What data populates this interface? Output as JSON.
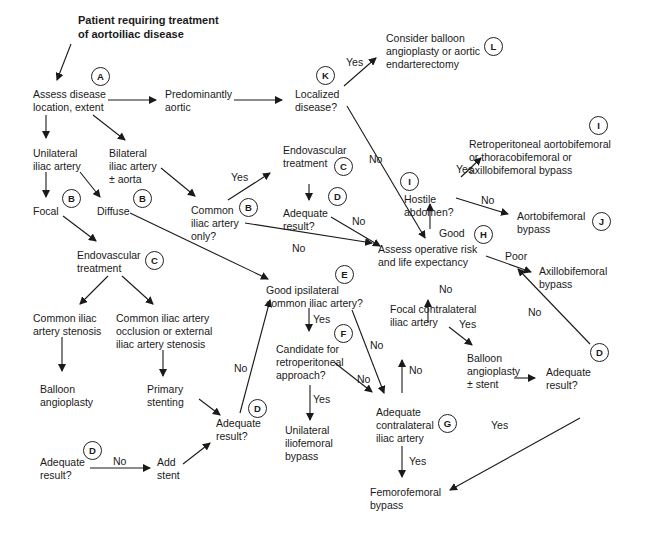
{
  "title": "Patient requiring treatment\nof aortoiliac disease",
  "nodes": {
    "assess": "Assess disease\nlocation, extent",
    "aortic": "Predominantly\naortic",
    "localized": "Localized\ndisease?",
    "balloon_aortic": "Consider balloon\nangioplasty or aortic\nendarterectomy",
    "unilateral": "Unilateral\niliac artery",
    "bilateral": "Bilateral\niliac artery\n± aorta",
    "focal": "Focal",
    "diffuse": "Diffuse",
    "common_only": "Common\niliac artery\nonly?",
    "endo_top": "Endovascular\ntreatment",
    "adequate_top": "Adequate\nresult?",
    "endo_mid": "Endovascular\ntreatment",
    "cia_stenosis": "Common iliac\nartery stenosis",
    "cia_occlusion": "Common iliac artery\nocclusion or external\niliac artery stenosis",
    "balloon": "Balloon\nangioplasty",
    "primary_stent": "Primary\nstenting",
    "adequate_bl": "Adequate\nresult?",
    "add_stent": "Add\nstent",
    "adequate_mid": "Adequate\nresult?",
    "good_ipsi": "Good ipsilateral\ncommon iliac artery?",
    "candidate": "Candidate for\nretroperitoneal\napproach?",
    "uni_ilio": "Unilateral\niliofemoral\nbypass",
    "adequate_contra": "Adequate\ncontralateral\niliac artery",
    "femfem": "Femorofemoral\nbypass",
    "focal_contra": "Focal contralateral\niliac artery",
    "balloon_stent": "Balloon\nangioplasty\n± stent",
    "adequate_right": "Adequate\nresult?",
    "op_risk": "Assess operative risk\nand life expectancy",
    "hostile": "Hostile\nabdomen?",
    "retro": "Retroperitoneal aortobifemoral\nor thoracobifemoral or\naxillobifemoral bypass",
    "aortobi": "Aortobifemoral\nbypass",
    "axillo": "Axillobifemoral\nbypass"
  },
  "badges": {
    "A": "A",
    "B1": "B",
    "B2": "B",
    "B3": "B",
    "C1": "C",
    "C2": "C",
    "D1": "D",
    "D2": "D",
    "D3": "D",
    "D4": "D",
    "E": "E",
    "F": "F",
    "G": "G",
    "H": "H",
    "I1": "I",
    "I2": "I",
    "J": "J",
    "K": "K",
    "L": "L"
  },
  "edge_labels": {
    "yes_localized": "Yes",
    "no_localized": "No",
    "yes_common": "Yes",
    "no_common": "No",
    "no_adequate_top": "No",
    "yes_hostile": "Yes",
    "no_hostile": "No",
    "good": "Good",
    "poor": "Poor",
    "no_focal_contra": "No",
    "yes_focal_contra": "Yes",
    "no_adequate_right": "No",
    "yes_adequate_right": "Yes",
    "yes_good_ipsi": "Yes",
    "no_good_ipsi": "No",
    "no_candidate": "No",
    "yes_candidate": "Yes",
    "no_adequate_contra": "No",
    "yes_adequate_contra": "Yes",
    "no_adequate_mid": "No",
    "no_adequate_bl": "No"
  }
}
